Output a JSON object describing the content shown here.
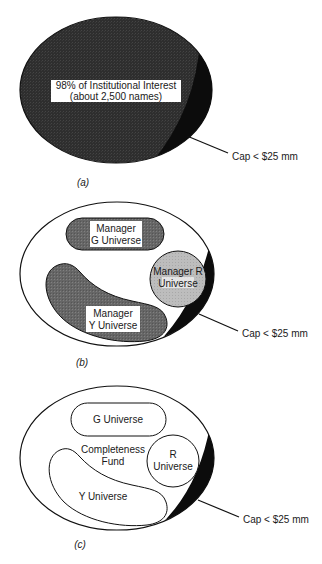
{
  "figure": {
    "panels": [
      {
        "id": "a",
        "label": "(a)",
        "main_region": {
          "line1": "98% of Institutional Interest",
          "line2": "(about 2,500 names)"
        },
        "callout": "Cap < $25 mm"
      },
      {
        "id": "b",
        "label": "(b)",
        "regions": {
          "g": {
            "line1": "Manager",
            "line2": "G Universe"
          },
          "r": {
            "line1": "Manager R",
            "line2": "Universe"
          },
          "y": {
            "line1": "Manager",
            "line2": "Y Universe"
          }
        },
        "callout": "Cap < $25 mm"
      },
      {
        "id": "c",
        "label": "(c)",
        "regions": {
          "g": {
            "line1": "G Universe"
          },
          "r": {
            "line1": "R",
            "line2": "Universe"
          },
          "y": {
            "line1": "Y Universe"
          },
          "fund": {
            "line1": "Completeness",
            "line2": "Fund"
          }
        },
        "callout": "Cap < $25 mm"
      }
    ]
  },
  "colors": {
    "dark_fill": "#2e2e2e",
    "medium_fill": "#6a6a6a",
    "light_fill": "#b8b8b8",
    "small_cap_sliver": "#000000",
    "outline": "#111111"
  }
}
